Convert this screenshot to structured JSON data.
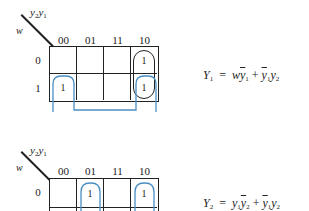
{
  "maps": [
    {
      "id": "kmap1",
      "column_variables": [
        "y2",
        "y1"
      ],
      "row_variable": "w",
      "column_headers": [
        "00",
        "01",
        "11",
        "10"
      ],
      "row_headers": [
        "0",
        "1"
      ],
      "cells": [
        [
          "",
          "",
          "",
          "1"
        ],
        [
          "1",
          "",
          "",
          "1"
        ]
      ],
      "equation": {
        "lhs": "Y1",
        "rhs": "w ȳ1 + ȳ1 y2",
        "display": "Y₁ = wȳ₁ + ȳ₁y₂"
      },
      "loops": [
        {
          "color": "#222222",
          "cells": [
            [
              0,
              3
            ],
            [
              1,
              3
            ]
          ],
          "term": "ȳ1 y2"
        },
        {
          "color": "#4a8fc4",
          "cells": [
            [
              1,
              0
            ],
            [
              1,
              3
            ]
          ],
          "term": "w ȳ1",
          "wraps": true
        }
      ]
    },
    {
      "id": "kmap2",
      "column_variables": [
        "y2",
        "y1"
      ],
      "row_variable": "w",
      "column_headers": [
        "00",
        "01",
        "11",
        "10"
      ],
      "row_headers": [
        "0"
      ],
      "cells": [
        [
          "",
          "1",
          "",
          "1"
        ]
      ],
      "equation": {
        "lhs": "Y2",
        "rhs": "y1 ȳ2 + ȳ1 y2",
        "display": "Y₂ = y₁ȳ₂ + ȳ₁y₂"
      },
      "loops": [
        {
          "color": "#4a8fc4",
          "cells": [
            [
              0,
              1
            ]
          ],
          "term": "y1 ȳ2"
        },
        {
          "color": "#4a8fc4",
          "cells": [
            [
              0,
              3
            ]
          ],
          "term": "ȳ1 y2"
        }
      ]
    }
  ],
  "labels": {
    "y2": "y",
    "y2_sub": "2",
    "y1": "y",
    "y1_sub": "1",
    "w": "w"
  },
  "colors": {
    "line": "#222222",
    "loop_blue": "#4a8fc4"
  }
}
